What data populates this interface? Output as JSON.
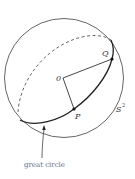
{
  "figure": {
    "labels": {
      "origin": "0",
      "point_p": "P",
      "point_q": "Q",
      "sphere": "S",
      "sphere_exp": "2",
      "caption": "great circle"
    },
    "colors": {
      "stroke": "#333333",
      "caption": "#5a6a8a",
      "background": "#ffffff"
    }
  }
}
